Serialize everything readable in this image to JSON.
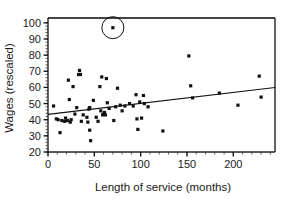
{
  "chart_data": {
    "type": "scatter",
    "title": "",
    "xlabel": "Length of service (months)",
    "ylabel": "Wages (rescaled)",
    "xlim": [
      0,
      245
    ],
    "ylim": [
      20,
      103
    ],
    "grid": false,
    "legend": null,
    "x_ticks": [
      0,
      50,
      100,
      150,
      200
    ],
    "y_ticks": [
      20,
      30,
      40,
      50,
      60,
      70,
      80,
      90,
      100
    ],
    "x_minor_tick_step": 10,
    "y_minor_tick_step": 2,
    "series": [
      {
        "name": "observations",
        "marker": "filled-square",
        "color": "#111111",
        "points": [
          [
            6,
            48.5
          ],
          [
            9,
            40.5
          ],
          [
            11,
            40.0
          ],
          [
            13,
            32.0
          ],
          [
            15,
            39.5
          ],
          [
            18,
            39.0
          ],
          [
            19,
            41.0
          ],
          [
            21,
            39.5
          ],
          [
            22,
            64.5
          ],
          [
            23,
            52.5
          ],
          [
            24,
            38.5
          ],
          [
            25,
            40.0
          ],
          [
            27,
            60.5
          ],
          [
            29,
            43.5
          ],
          [
            31,
            47.5
          ],
          [
            33,
            68.0
          ],
          [
            34,
            70.5
          ],
          [
            35,
            68.0
          ],
          [
            36,
            39.0
          ],
          [
            38,
            43.0
          ],
          [
            42,
            41.5
          ],
          [
            43,
            38.5
          ],
          [
            44,
            46.5
          ],
          [
            45,
            47.5
          ],
          [
            45,
            33.5
          ],
          [
            46,
            27.0
          ],
          [
            49,
            52.0
          ],
          [
            52,
            41.5
          ],
          [
            54,
            39.0
          ],
          [
            56,
            60.5
          ],
          [
            57,
            45.5
          ],
          [
            58,
            66.5
          ],
          [
            59,
            43.0
          ],
          [
            60,
            43.5
          ],
          [
            61,
            44.5
          ],
          [
            62,
            43.0
          ],
          [
            63,
            65.5
          ],
          [
            64,
            50.5
          ],
          [
            66,
            47.0
          ],
          [
            70,
            97.0
          ],
          [
            71,
            39.5
          ],
          [
            73,
            48.0
          ],
          [
            75,
            59.5
          ],
          [
            78,
            49.0
          ],
          [
            80,
            45.5
          ],
          [
            83,
            48.5
          ],
          [
            88,
            50.0
          ],
          [
            92,
            48.5
          ],
          [
            95,
            55.5
          ],
          [
            96,
            40.5
          ],
          [
            97,
            34.0
          ],
          [
            99,
            51.0
          ],
          [
            101,
            41.0
          ],
          [
            103,
            55.0
          ],
          [
            104,
            50.0
          ],
          [
            108,
            48.0
          ],
          [
            124,
            33.0
          ],
          [
            152,
            79.5
          ],
          [
            154,
            61.0
          ],
          [
            156,
            53.5
          ],
          [
            185,
            56.5
          ],
          [
            205,
            49.0
          ],
          [
            228,
            67.0
          ],
          [
            230,
            54.0
          ]
        ]
      }
    ],
    "annotations": [
      {
        "name": "circled-outlier",
        "shape": "circle-highlight",
        "x": 70,
        "y": 97,
        "radius_px": 11
      }
    ],
    "trendline": {
      "name": "regression-line",
      "color": "#111111",
      "x_start": 0,
      "y_start": 43.3,
      "x_end": 245,
      "y_end": 60.0
    }
  },
  "axis": {
    "x_title": "Length of service (months)",
    "y_title": "Wages (rescaled)",
    "x_tick_labels": [
      "0",
      "50",
      "100",
      "150",
      "200"
    ],
    "y_tick_labels": [
      "20",
      "30",
      "40",
      "50",
      "60",
      "70",
      "80",
      "90",
      "100"
    ]
  }
}
